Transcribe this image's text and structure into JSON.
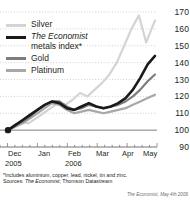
{
  "chart_data": {
    "type": "line",
    "title": "",
    "subtitle": "",
    "xlabel": "",
    "ylabel": "",
    "ylim": [
      90,
      170
    ],
    "ytick_values": [
      90,
      100,
      110,
      120,
      130,
      140,
      150,
      160,
      170
    ],
    "ytick_labels": [
      "90",
      "100",
      "110",
      "120",
      "130",
      "140",
      "150",
      "160",
      "170"
    ],
    "yaxis_position": "right",
    "baseline_value": 100,
    "grid": "dotted-horizontal",
    "legend_position": "top-left",
    "x_start_label": "Dec 2005",
    "x_end_label": "May 2006",
    "xtick_labels": [
      "Dec",
      "Jan",
      "Feb",
      "Mar",
      "Apr",
      "May"
    ],
    "xtick_years": [
      {
        "label": "2005",
        "at": "Dec"
      },
      {
        "label": "2006",
        "at": "Feb"
      }
    ],
    "series": [
      {
        "name": "Silver",
        "color": "#d4d4d4",
        "x": [
          0,
          4,
          9,
          14,
          19,
          24,
          29,
          34,
          39,
          44,
          49,
          54,
          59,
          64,
          69,
          74,
          79,
          84,
          89,
          94,
          100
        ],
        "values": [
          100,
          103,
          105,
          104,
          107,
          110,
          113,
          116,
          115,
          118,
          122,
          120,
          124,
          128,
          133,
          140,
          150,
          160,
          168,
          152,
          165
        ]
      },
      {
        "name": "The Economist metals index*",
        "color": "#1a1a1a",
        "x": [
          0,
          5,
          10,
          15,
          20,
          25,
          30,
          35,
          40,
          45,
          50,
          55,
          60,
          65,
          70,
          75,
          80,
          85,
          90,
          95,
          100
        ],
        "values": [
          100,
          103,
          106,
          109,
          112,
          115,
          117,
          116,
          113,
          112,
          114,
          116,
          114,
          113,
          114,
          116,
          119,
          124,
          131,
          139,
          144
        ]
      },
      {
        "name": "Gold",
        "color": "#7d7d7d",
        "x": [
          0,
          5,
          10,
          15,
          20,
          25,
          30,
          35,
          40,
          45,
          50,
          55,
          60,
          65,
          70,
          75,
          80,
          85,
          90,
          95,
          100
        ],
        "values": [
          100,
          103,
          105,
          108,
          112,
          115,
          117,
          117,
          114,
          112,
          113,
          115,
          114,
          113,
          114,
          115,
          117,
          120,
          124,
          129,
          133
        ]
      },
      {
        "name": "Platinum",
        "color": "#a8a8a8",
        "x": [
          0,
          5,
          10,
          15,
          20,
          25,
          30,
          35,
          40,
          45,
          50,
          55,
          60,
          65,
          70,
          75,
          80,
          85,
          90,
          95,
          100
        ],
        "values": [
          100,
          102,
          104,
          107,
          110,
          113,
          116,
          115,
          112,
          110,
          111,
          112,
          111,
          110,
          111,
          112,
          113,
          115,
          117,
          119,
          121
        ]
      }
    ],
    "start_marker": {
      "value": 100,
      "color": "#1a1a1a",
      "shape": "dot"
    }
  },
  "legend": {
    "items": [
      {
        "label": "Silver",
        "label2": "",
        "color": "#d4d4d4",
        "italic_part": ""
      },
      {
        "label": "The Economist",
        "label2": "metals index*",
        "color": "#1a1a1a",
        "italic_part": "The Economist"
      },
      {
        "label": "Gold",
        "label2": "",
        "color": "#7d7d7d",
        "italic_part": ""
      },
      {
        "label": "Platinum",
        "label2": "",
        "color": "#a8a8a8",
        "italic_part": ""
      }
    ]
  },
  "notes": {
    "footnote": "*Includes aluminium, copper, lead, nickel, tin and zinc.",
    "sources_prefix": "Sources: ",
    "sources_italic": "The Economist",
    "sources_rest": "; Thomson Datastream",
    "credit": "The Economist, May 4th 2006"
  },
  "colors": {
    "text": "#231f20",
    "grid": "#bfbfbf",
    "axis": "#6d6e71",
    "background": "#ffffff"
  }
}
